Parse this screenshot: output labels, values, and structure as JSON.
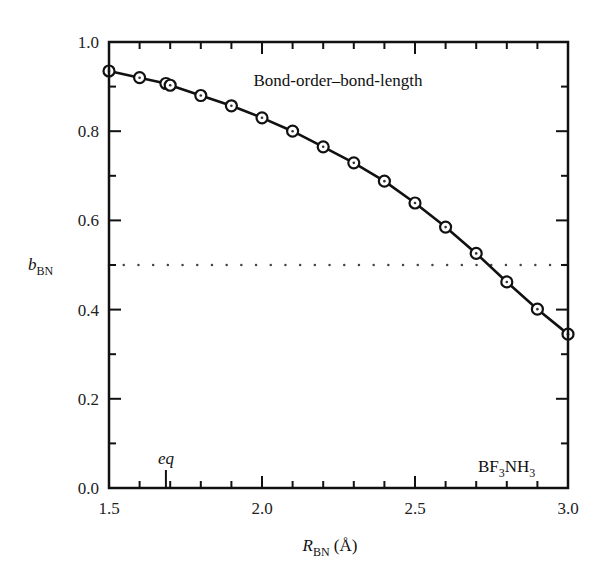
{
  "chart_data": {
    "type": "line",
    "title": "",
    "annotation_top": "Bond-order–bond-length",
    "annotation_bottom": {
      "base1": "BF",
      "sub1": "3",
      "base2": "NH",
      "sub2": "3"
    },
    "xlabel": {
      "main": "R",
      "sub": "BN",
      "unit": " (Å)"
    },
    "ylabel": {
      "main": "b",
      "sub": "BN"
    },
    "xlim": [
      1.5,
      3.0
    ],
    "ylim": [
      0.0,
      1.0
    ],
    "x_ticks_major": [
      1.5,
      2.0,
      2.5,
      3.0
    ],
    "x_tick_labels": [
      "1.5",
      "2.0",
      "2.5",
      "3.0"
    ],
    "x_ticks_minor_step": 0.1,
    "y_ticks_major": [
      0.0,
      0.2,
      0.4,
      0.6,
      0.8,
      1.0
    ],
    "y_tick_labels": [
      "0.0",
      "0.2",
      "0.4",
      "0.6",
      "0.8",
      "1.0"
    ],
    "y_ticks_minor_step": 0.1,
    "grid": false,
    "reference_line": {
      "y": 0.5,
      "style": "dotted"
    },
    "eq_marker": {
      "x": 1.686,
      "label": "eq"
    },
    "series": [
      {
        "name": "b_BN",
        "marker": "circle-with-dot",
        "x": [
          1.5,
          1.6,
          1.686,
          1.7,
          1.8,
          1.9,
          2.0,
          2.1,
          2.2,
          2.3,
          2.4,
          2.5,
          2.6,
          2.7,
          2.8,
          2.9,
          3.0
        ],
        "y": [
          0.935,
          0.92,
          0.907,
          0.903,
          0.88,
          0.857,
          0.83,
          0.8,
          0.765,
          0.729,
          0.688,
          0.639,
          0.585,
          0.526,
          0.462,
          0.401,
          0.345
        ]
      }
    ]
  }
}
